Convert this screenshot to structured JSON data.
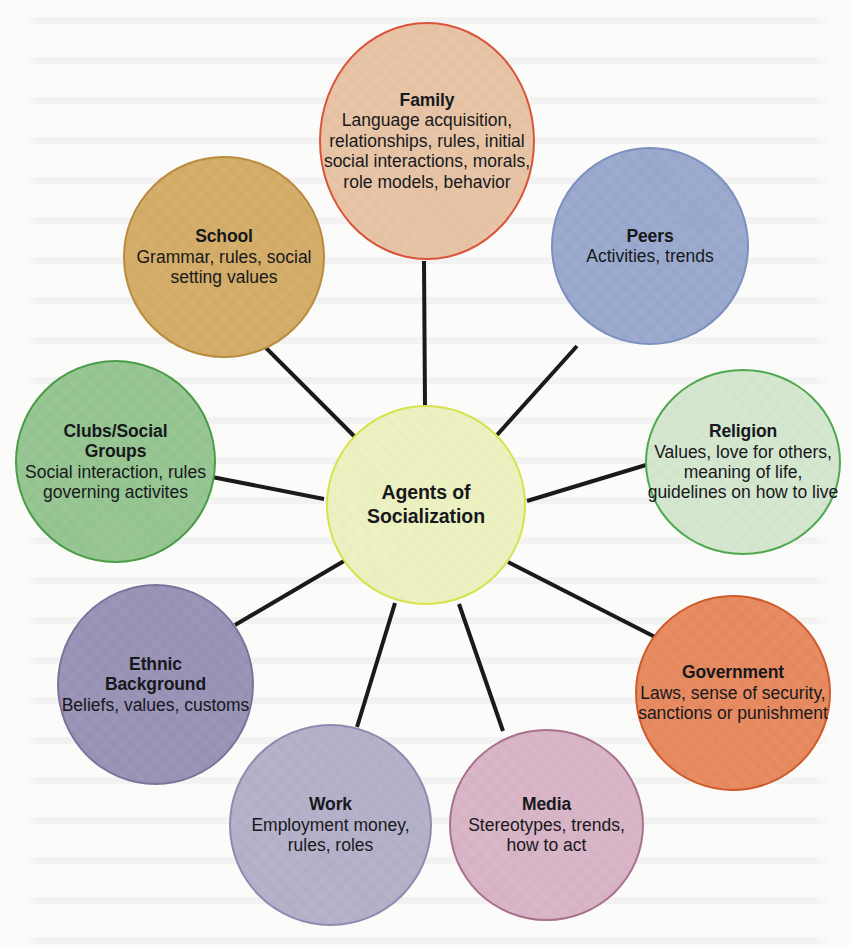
{
  "diagram": {
    "type": "hub-and-spoke concept map",
    "title": "Agents of Socialization",
    "background_color": "#fbfbf9",
    "connector_color": "#1a1a1a",
    "center": {
      "id": "center",
      "title": "Agents of",
      "title2": "Socialization",
      "fill": "#eef3c0",
      "stroke": "#d6e34a"
    },
    "nodes": [
      {
        "id": "family",
        "title": "Family",
        "body": "Language acquisition, relationships, rules, initial social interactions, morals, role models, behavior",
        "fill": "#e9c3a3",
        "stroke": "#d9543a"
      },
      {
        "id": "peers",
        "title": "Peers",
        "body": "Activities, trends",
        "fill": "#97a7cd",
        "stroke": "#7c8fbe"
      },
      {
        "id": "religion",
        "title": "Religion",
        "body": "Values, love for others, meaning of life, guidelines on how to live",
        "fill": "#d5e8cf",
        "stroke": "#4fa84f"
      },
      {
        "id": "government",
        "title": "Government",
        "body": "Laws, sense of security, sanctions or punishment",
        "fill": "#e8865a",
        "stroke": "#cf5a2c"
      },
      {
        "id": "media",
        "title": "Media",
        "body": "Stereotypes, trends, how to act",
        "fill": "#d9b3c6",
        "stroke": "#a9718c"
      },
      {
        "id": "work",
        "title": "Work",
        "body": "Employment money, rules, roles",
        "fill": "#b3afc9",
        "stroke": "#8f8ab0"
      },
      {
        "id": "ethnic_background",
        "title": "Ethnic",
        "title2": "Background",
        "body": "Beliefs, values, customs",
        "fill": "#9690b5",
        "stroke": "#7a739c"
      },
      {
        "id": "clubs_social_groups",
        "title": "Clubs/Social",
        "title2": "Groups",
        "body": "Social interaction, rules governing activites",
        "fill": "#93c58e",
        "stroke": "#4a9c45"
      },
      {
        "id": "school",
        "title": "School",
        "body": "Grammar, rules, social setting values",
        "fill": "#d4ab63",
        "stroke": "#b98c3f"
      }
    ]
  }
}
